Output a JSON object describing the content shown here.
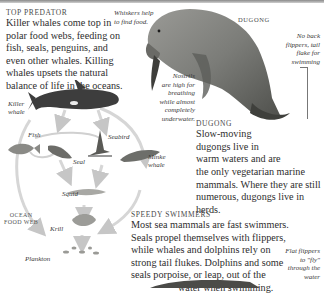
{
  "top_predator": {
    "heading": "Top predator",
    "body_lines": [
      "Killer whales come top in",
      "polar food webs, feeding on",
      "fish, seals, penguins, and",
      "even other whales. Killing",
      "whales upsets the natural",
      "balance of life in the oceans."
    ]
  },
  "whiskers_caption": [
    "Whiskers help",
    "to find food."
  ],
  "dugong_label": "Dugong",
  "no_back_caption": [
    "No back",
    "flippers, tail",
    "flake for",
    "swimming"
  ],
  "nostrils_caption": [
    "Nostrils",
    "are high for",
    "breathing",
    "while almost",
    "completely",
    "underwater."
  ],
  "dugong_section": {
    "heading": "Dugong",
    "body_lines": [
      "Slow-moving",
      "dugongs live in",
      "warm waters and are",
      "the only vegetarian marine",
      "mammals. Where they are still",
      "numerous, dugongs live in herds."
    ]
  },
  "food_web": {
    "title_lines": [
      "Ocean",
      "food web"
    ],
    "labels": {
      "killer_whale": [
        "Killer",
        "whale"
      ],
      "fish": "Fish",
      "seabird": "Seabird",
      "seal": "Seal",
      "minke_whale": [
        "Minke",
        "whale"
      ],
      "squid": "Squid",
      "krill": "Krill",
      "plankton": "Plankton"
    }
  },
  "speedy_swimmers": {
    "heading": "Speedy swimmers",
    "body_lines": [
      "Most sea mammals are fast swimmers.",
      "Seals propel themselves with flippers,",
      "while whales and dolphins rely on",
      "strong tail flukes. Dolphins and some",
      "seals porpoise, or leap, out of the",
      "water when swimming."
    ]
  },
  "flat_flippers_caption": [
    "Flat flippers",
    "to \"fly\"",
    "through the",
    "water"
  ]
}
